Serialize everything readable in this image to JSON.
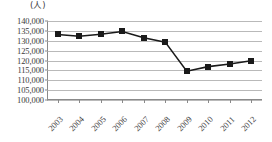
{
  "chart_data": {
    "type": "line",
    "title": "",
    "subtitle": "",
    "unit_label": "(人)",
    "xlabel": "",
    "ylabel": "",
    "categories": [
      "2003",
      "2004",
      "2005",
      "2006",
      "2007",
      "2008",
      "2009",
      "2010",
      "2011",
      "2012"
    ],
    "values": [
      133200,
      132300,
      133300,
      134700,
      131500,
      129300,
      114600,
      116900,
      118200,
      119900
    ],
    "series": [
      {
        "name": "",
        "values": [
          133200,
          132300,
          133300,
          134700,
          131500,
          129300,
          114600,
          116900,
          118200,
          119900
        ]
      }
    ],
    "ylim": [
      100000,
      140000
    ],
    "ytick_step": 5000,
    "ytick_labels": [
      "140,000",
      "135,000",
      "130,000",
      "125,000",
      "120,000",
      "115,000",
      "110,000",
      "105,000",
      "100,000"
    ],
    "ytick_values": [
      140000,
      135000,
      130000,
      125000,
      120000,
      115000,
      110000,
      105000,
      100000
    ],
    "grid": true,
    "legend": false,
    "legend_position": "none",
    "marker": "square",
    "colors": {
      "line": "#1a1a1a",
      "marker": "#1a1a1a",
      "grid": "#b9b9b9",
      "axis": "#8a8a8a",
      "text": "#3a3a3a",
      "background": "#ffffff"
    }
  }
}
